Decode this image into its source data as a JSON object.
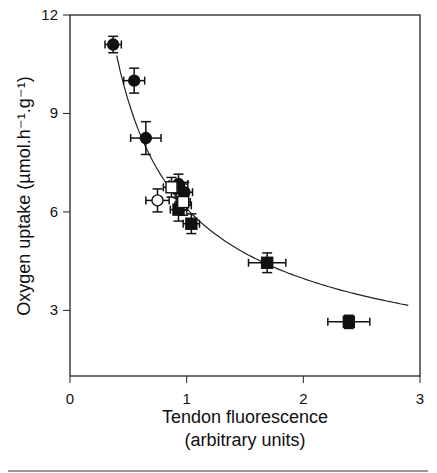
{
  "chart_data": {
    "type": "scatter",
    "title": "",
    "xlabel_line1": "Tendon fluorescence",
    "xlabel_line2": "(arbitrary units)",
    "ylabel": "Oxygen uptake (µmol.h⁻¹.g⁻¹)",
    "xlim": [
      0,
      3
    ],
    "ylim": [
      1,
      12
    ],
    "x_ticks": [
      0,
      1,
      2,
      3
    ],
    "x_tick_labels": [
      "0",
      "1",
      "2",
      "3"
    ],
    "y_ticks": [
      3,
      6,
      9,
      12
    ],
    "y_tick_labels": [
      "3",
      "6",
      "9",
      "12"
    ],
    "grid": false,
    "legend": null,
    "series": [
      {
        "name": "filled circles",
        "marker": "circle-filled",
        "points": [
          {
            "x": 0.37,
            "y": 11.1,
            "xerr": 0.07,
            "yerr": 0.25
          },
          {
            "x": 0.55,
            "y": 10.0,
            "xerr": 0.09,
            "yerr": 0.38
          },
          {
            "x": 0.65,
            "y": 8.25,
            "xerr": 0.13,
            "yerr": 0.5
          },
          {
            "x": 0.93,
            "y": 6.85,
            "xerr": 0.08,
            "yerr": 0.3
          },
          {
            "x": 0.98,
            "y": 6.6,
            "xerr": 0.07,
            "yerr": 0.3
          }
        ]
      },
      {
        "name": "open circles",
        "marker": "circle-open",
        "points": [
          {
            "x": 0.75,
            "y": 6.35,
            "xerr": 0.1,
            "yerr": 0.35
          },
          {
            "x": 0.97,
            "y": 6.2,
            "xerr": 0.07,
            "yerr": 0.3
          }
        ]
      },
      {
        "name": "filled squares",
        "marker": "square-filled",
        "points": [
          {
            "x": 0.93,
            "y": 6.07,
            "xerr": 0.07,
            "yerr": 0.35
          },
          {
            "x": 1.04,
            "y": 5.64,
            "xerr": 0.07,
            "yerr": 0.3
          },
          {
            "x": 1.69,
            "y": 4.45,
            "xerr": 0.16,
            "yerr": 0.3
          },
          {
            "x": 2.39,
            "y": 2.65,
            "xerr": 0.18,
            "yerr": 0.2
          }
        ]
      },
      {
        "name": "open squares",
        "marker": "square-open",
        "points": [
          {
            "x": 0.87,
            "y": 6.75,
            "xerr": 0.07,
            "yerr": 0.3
          },
          {
            "x": 0.97,
            "y": 6.3,
            "xerr": 0.06,
            "yerr": 0.25
          }
        ]
      }
    ],
    "fit_curve": {
      "model": "power",
      "a": 6.1,
      "b": -0.62,
      "x_start": 0.4,
      "x_end": 2.9
    }
  }
}
